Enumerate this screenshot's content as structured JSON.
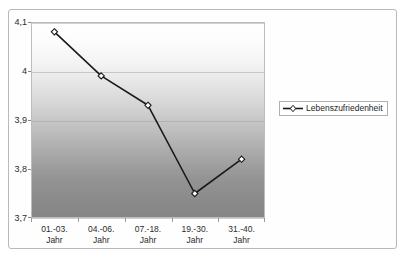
{
  "chart_data": {
    "type": "line",
    "title": "",
    "xlabel": "",
    "ylabel": "",
    "ylim": [
      3.7,
      4.1
    ],
    "yticks": [
      "3,7",
      "3,8",
      "3,9",
      "4",
      "4,1"
    ],
    "ytick_values": [
      3.7,
      3.8,
      3.9,
      4.0,
      4.1
    ],
    "grid": true,
    "legend_position": "right",
    "categories": [
      "01.-03. Jahr",
      "04.-06. Jahr",
      "07.-18. Jahr",
      "19.-30. Jahr",
      "31.-40. Jahr"
    ],
    "category_lines": [
      [
        "01.-03.",
        "Jahr"
      ],
      [
        "04.-06.",
        "Jahr"
      ],
      [
        "07.-18.",
        "Jahr"
      ],
      [
        "19.-30.",
        "Jahr"
      ],
      [
        "31.-40.",
        "Jahr"
      ]
    ],
    "series": [
      {
        "name": "Lebenszufriedenheit",
        "values": [
          4.08,
          3.99,
          3.93,
          3.75,
          3.82
        ],
        "marker": "diamond-open",
        "line_color": "#1a1a1a",
        "marker_fill": "#ffffff"
      }
    ]
  },
  "legend": {
    "entries": [
      {
        "label": "Lebenszufriedenheit"
      }
    ]
  },
  "colors": {
    "line": "#1a1a1a",
    "marker_fill": "#ffffff",
    "plot_border": "#bdbdbd",
    "frame": "#b9b9b9",
    "gridline": "#969696",
    "text": "#2b2b2b"
  }
}
